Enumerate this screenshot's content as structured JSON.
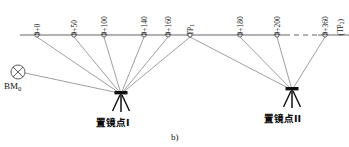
{
  "figure": {
    "caption": "b)",
    "baseline": {
      "y": 35,
      "x_start": 20,
      "x_end": 349,
      "dash_gap": {
        "x_from": 285,
        "x_to": 318
      }
    },
    "benchmark": {
      "name": "benchmark-bm0",
      "label": "BM",
      "subscript": "0",
      "x": 18,
      "y": 72,
      "radius": 7
    },
    "stations": [
      {
        "id": "sta-0-000",
        "label": "0+0",
        "sub": "",
        "x": 37,
        "y": 35,
        "tie": "instrument-1"
      },
      {
        "id": "sta-0-050",
        "label": "0+50",
        "sub": "",
        "x": 74,
        "y": 35,
        "tie": "instrument-1"
      },
      {
        "id": "sta-0-100",
        "label": "0+100",
        "sub": "",
        "x": 104,
        "y": 35,
        "tie": "instrument-1"
      },
      {
        "id": "sta-0-140",
        "label": "0+140",
        "sub": "",
        "x": 144,
        "y": 35,
        "tie": "instrument-1"
      },
      {
        "id": "sta-0-160",
        "label": "0+160",
        "sub": "",
        "x": 168,
        "y": 35,
        "tie": "instrument-1"
      },
      {
        "id": "sta-tp1",
        "label": "TP",
        "sub": "1",
        "x": 190,
        "y": 35,
        "tie": "both"
      },
      {
        "id": "sta-0-180",
        "label": "0+180",
        "sub": "",
        "x": 240,
        "y": 35,
        "tie": "instrument-2"
      },
      {
        "id": "sta-0-200",
        "label": "0+200",
        "sub": "",
        "x": 277,
        "y": 35,
        "tie": "instrument-2"
      },
      {
        "id": "sta-0-360",
        "label": "0+360",
        "sub": "",
        "x": 325,
        "y": 35,
        "tie": "instrument-2"
      },
      {
        "id": "sta-tp2",
        "label": "(TP",
        "sub": "2",
        "suffix": ")",
        "x": 340,
        "y": 35,
        "tie": "none"
      }
    ],
    "instruments": [
      {
        "id": "instrument-1",
        "label": "置镜点I",
        "x": 121,
        "y": 96
      },
      {
        "id": "instrument-2",
        "label": "置镜点II",
        "x": 292,
        "y": 92
      }
    ],
    "colors": {
      "line": "#55555a",
      "sight_line": "#6a6a70",
      "node_stroke": "#4a4a50",
      "node_fill": "#ffffff",
      "text": "#111111",
      "instrument": "#101010",
      "background": "#ffffff"
    }
  }
}
